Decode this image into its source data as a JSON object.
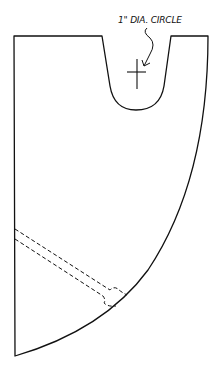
{
  "diagram": {
    "type": "pattern-template",
    "annotation": {
      "text": "1\" DIA. CIRCLE",
      "points_to": "center-mark"
    },
    "colors": {
      "line": "#111111",
      "background": "#ffffff"
    },
    "features": [
      {
        "name": "outline",
        "style": "solid"
      },
      {
        "name": "top-notch",
        "style": "solid"
      },
      {
        "name": "center-mark",
        "style": "crosshair"
      },
      {
        "name": "slot",
        "style": "dashed"
      }
    ]
  }
}
